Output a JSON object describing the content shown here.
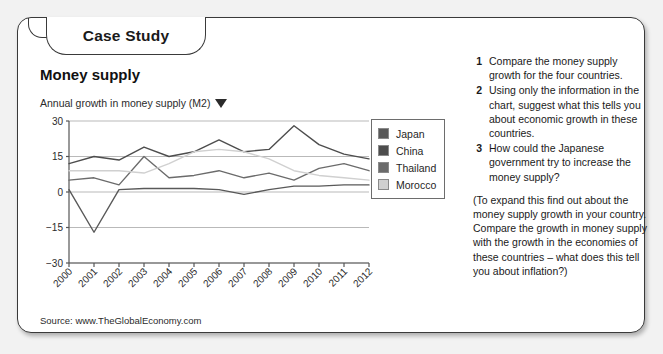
{
  "card": {
    "tab_label": "Case Study",
    "section_title": "Money supply"
  },
  "chart_caption": {
    "text": "Annual growth in money supply (M2)",
    "dropdown_icon": "caret-down-icon"
  },
  "source": {
    "text": "Source: www.TheGlobalEconomy.com"
  },
  "legend": {
    "items": [
      {
        "label": "Japan",
        "color": "#595959"
      },
      {
        "label": "China",
        "color": "#4d4d4d"
      },
      {
        "label": "Thailand",
        "color": "#6b6b6b"
      },
      {
        "label": "Morocco",
        "color": "#d0d0d0"
      }
    ]
  },
  "questions": [
    {
      "num": "1",
      "text": "Compare the money supply growth for the four countries."
    },
    {
      "num": "2",
      "text": "Using only the information in the chart, suggest what this tells you about economic growth in these countries."
    },
    {
      "num": "3",
      "text": "How could the Japanese government try to increase the money supply?"
    }
  ],
  "expand_note": "(To expand this find out about the money supply growth in your country. Compare the growth in money supply with the growth in the economies of these countries – what does this tell you about inflation?)",
  "chart_data": {
    "type": "line",
    "title": "Annual growth in money supply (M2)",
    "xlabel": "",
    "ylabel": "",
    "ylim": [
      -30,
      30
    ],
    "yticks": [
      30,
      15,
      0,
      -15,
      -30
    ],
    "grid": true,
    "legend_position": "right",
    "categories": [
      "2000",
      "2001",
      "2002",
      "2003",
      "2004",
      "2005",
      "2006",
      "2007",
      "2008",
      "2009",
      "2010",
      "2011",
      "2012"
    ],
    "series": [
      {
        "name": "China",
        "color": "#4d4d4d",
        "values": [
          12,
          15,
          13.5,
          19,
          15,
          17,
          22,
          17,
          18,
          28,
          20,
          16,
          14
        ]
      },
      {
        "name": "Thailand",
        "color": "#6b6b6b",
        "values": [
          5,
          6,
          3,
          15,
          6,
          7,
          9,
          6,
          8,
          5,
          10,
          12,
          9
        ]
      },
      {
        "name": "Morocco",
        "color": "#d0d0d0",
        "values": [
          9,
          9,
          9,
          8,
          12,
          17,
          18,
          17,
          14,
          9,
          7,
          6,
          5
        ]
      },
      {
        "name": "Japan",
        "color": "#595959",
        "values": [
          1,
          -17,
          1,
          1.5,
          1.5,
          1.5,
          1,
          -1,
          1,
          2.5,
          2.5,
          3,
          3
        ]
      }
    ]
  }
}
